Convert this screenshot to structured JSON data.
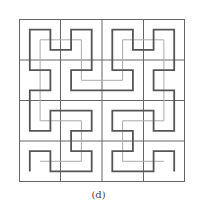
{
  "caption": "(d)",
  "diagram": {
    "type": "hilbert-curve",
    "grid": {
      "cols": 4,
      "rows": 4,
      "color": "#555555"
    },
    "thick_curve": {
      "order": 3,
      "color": "#555555"
    },
    "thin_curve": {
      "order": 2,
      "color": "#aaaaaa"
    }
  }
}
